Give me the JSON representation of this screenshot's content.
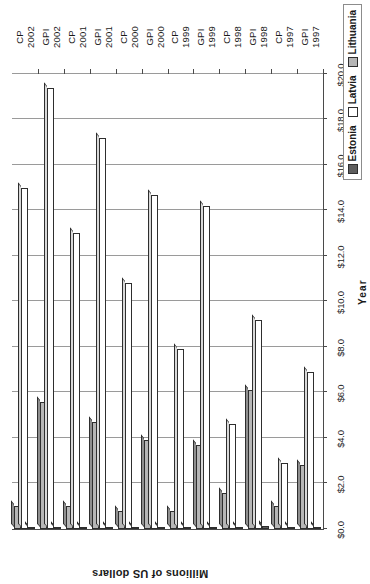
{
  "chart_data": {
    "type": "bar",
    "orientation": "horizontal",
    "title": "",
    "xlabel": "Year",
    "ylabel": "Millions of US dollars",
    "ylim": [
      0,
      20
    ],
    "ytick_step": 2,
    "grid": true,
    "legend_position": "bottom-right",
    "ytick_labels": [
      "$0.0",
      "$2.0",
      "$4.0",
      "$6.0",
      "$8.0",
      "$10.0",
      "$12.0",
      "$14.0",
      "$16.0",
      "$18.0",
      "$20.0"
    ],
    "ytick_values": [
      0,
      2,
      4,
      6,
      8,
      10,
      12,
      14,
      16,
      18,
      20
    ],
    "categories": [
      {
        "program": "GPI",
        "year": "1997"
      },
      {
        "program": "CP",
        "year": "1997"
      },
      {
        "program": "GPI",
        "year": "1998"
      },
      {
        "program": "CP",
        "year": "1998"
      },
      {
        "program": "GPI",
        "year": "1999"
      },
      {
        "program": "CP",
        "year": "1999"
      },
      {
        "program": "GPI",
        "year": "2000"
      },
      {
        "program": "CP",
        "year": "2000"
      },
      {
        "program": "GPI",
        "year": "2001"
      },
      {
        "program": "CP",
        "year": "2001"
      },
      {
        "program": "GPI",
        "year": "2002"
      },
      {
        "program": "CP",
        "year": "2002"
      }
    ],
    "series": [
      {
        "name": "Estonia",
        "color": "#5e5e5e",
        "values": [
          0.1,
          0.1,
          0.15,
          0.1,
          0.1,
          0.1,
          0.1,
          0.1,
          0.1,
          0.1,
          0.1,
          0.1
        ]
      },
      {
        "name": "Latvia",
        "color": "#ffffff",
        "values": [
          6.9,
          2.9,
          9.2,
          4.6,
          14.2,
          7.9,
          14.7,
          10.8,
          17.2,
          13.0,
          19.4,
          15.0
        ]
      },
      {
        "name": "Lithuania",
        "color": "#b6b6b6",
        "values": [
          2.8,
          1.0,
          6.1,
          1.6,
          3.7,
          0.8,
          3.9,
          0.8,
          4.7,
          1.0,
          5.6,
          1.0
        ]
      }
    ]
  },
  "legend": {
    "items": [
      {
        "label": "Estonia"
      },
      {
        "label": "Latvia"
      },
      {
        "label": "Lithuania"
      }
    ]
  }
}
